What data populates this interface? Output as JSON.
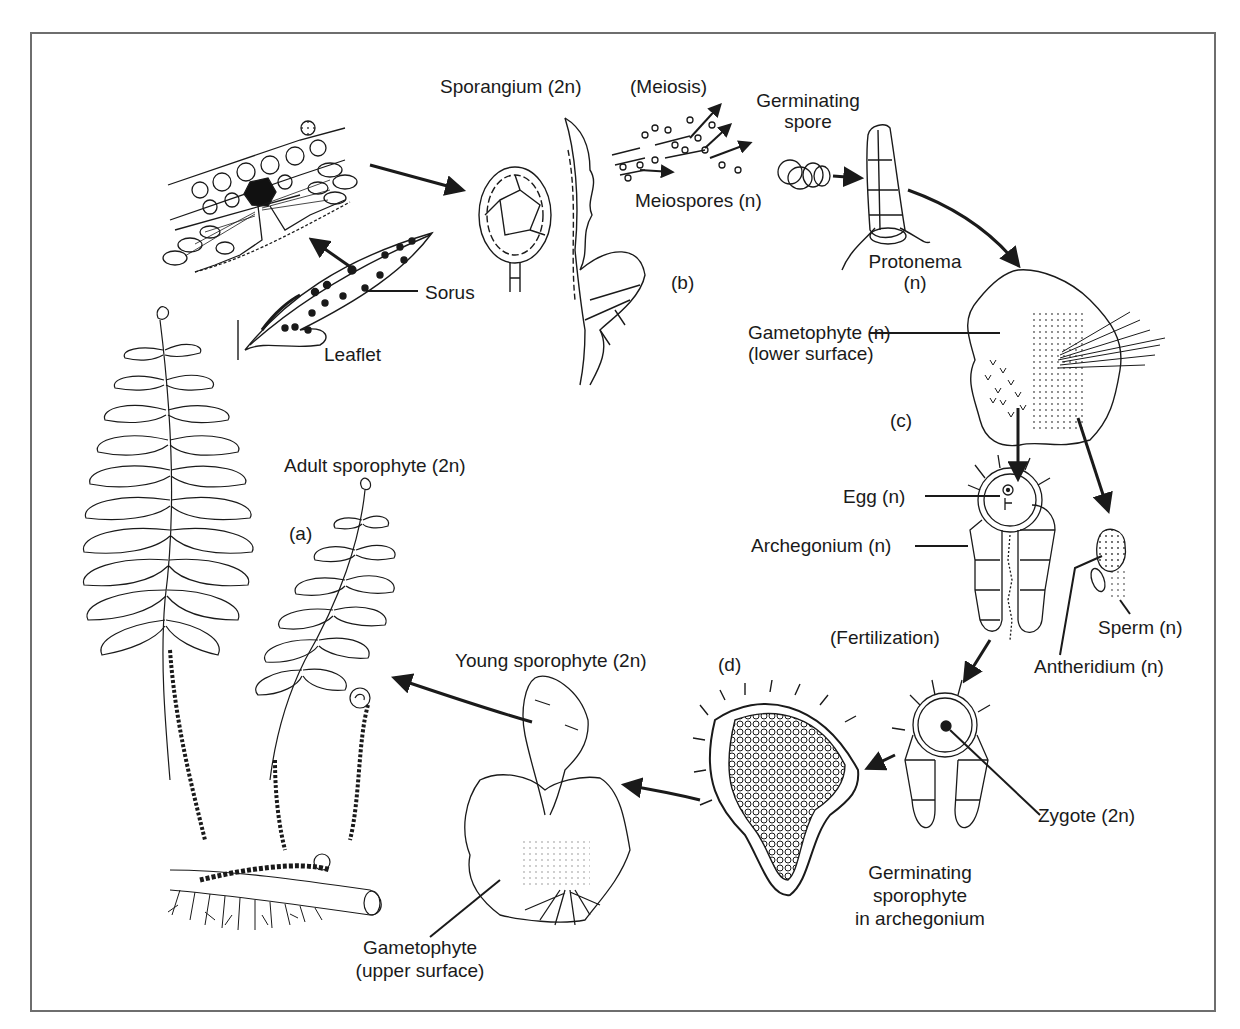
{
  "diagram": {
    "stages": {
      "a": "(a)",
      "b": "(b)",
      "c": "(c)",
      "d": "(d)"
    },
    "labels": {
      "sporangium": "Sporangium (2n)",
      "meiosis": "(Meiosis)",
      "germinating_spore_1": "Germinating",
      "germinating_spore_2": "spore",
      "meiospores": "Meiospores (n)",
      "protonema_1": "Protonema",
      "protonema_2": "(n)",
      "sorus": "Sorus",
      "leaflet": "Leaflet",
      "gametophyte_lower_1": "Gametophyte (n)",
      "gametophyte_lower_2": "(lower surface)",
      "adult_sporophyte": "Adult sporophyte (2n)",
      "egg": "Egg (n)",
      "archegonium": "Archegonium (n)",
      "fertilization": "(Fertilization)",
      "sperm": "Sperm (n)",
      "antheridium": "Antheridium (n)",
      "young_sporophyte": "Young sporophyte (2n)",
      "zygote": "Zygote (2n)",
      "germinating_sporophyte_1": "Germinating",
      "germinating_sporophyte_2": "sporophyte",
      "germinating_sporophyte_3": "in archegonium",
      "gametophyte_upper_1": "Gametophyte",
      "gametophyte_upper_2": "(upper surface)"
    },
    "colors": {
      "ink": "#1a1a1a",
      "frame": "#6e6e6e",
      "background": "#ffffff"
    }
  }
}
